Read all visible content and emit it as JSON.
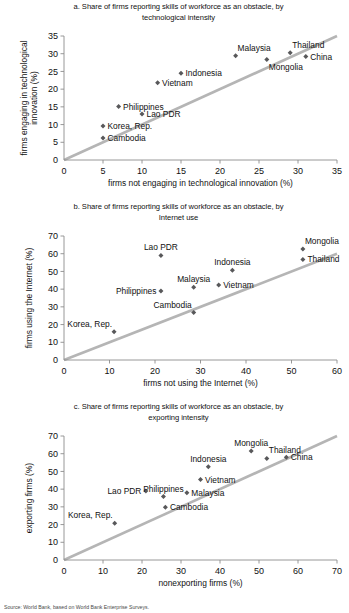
{
  "figure": {
    "source_note": "Source: World Bank, based on World Bank Enterprise Surveys.",
    "marker_color": "#58585a",
    "line_color": "#b5b5b5",
    "axis_color": "#8c8c8c",
    "text_color": "#111111"
  },
  "chart_data": [
    {
      "id": "a",
      "type": "scatter",
      "title": "a. Share of firms reporting skills of workforce as an obstacle, by technological intensity",
      "title_line1": "a. Share of firms reporting skills of workforce as an obstacle, by",
      "title_line2": "technological intensity",
      "xlabel": "firms not engaging in technological innovation (%)",
      "ylabel": "firms engaging in technological innovation (%)",
      "ylabel_line1": "firms engaging in technological",
      "ylabel_line2": "innovation (%)",
      "xlim": [
        0,
        35
      ],
      "ylim": [
        0,
        35
      ],
      "xticks": [
        0,
        5,
        10,
        15,
        20,
        25,
        30,
        35
      ],
      "yticks": [
        0,
        5,
        10,
        15,
        20,
        25,
        30,
        35
      ],
      "grid": false,
      "reference_line": {
        "type": "45-degree",
        "from": [
          0,
          0
        ],
        "to": [
          35,
          35
        ]
      },
      "points": [
        {
          "label": "Cambodia",
          "x": 5.0,
          "y": 6.2,
          "label_pos": "right"
        },
        {
          "label": "Korea, Rep.",
          "x": 5.0,
          "y": 9.6,
          "label_pos": "right"
        },
        {
          "label": "Philippines",
          "x": 7.0,
          "y": 15.1,
          "label_pos": "right"
        },
        {
          "label": "Lao PDR",
          "x": 10.0,
          "y": 13.0,
          "label_pos": "right"
        },
        {
          "label": "Vietnam",
          "x": 12.0,
          "y": 21.8,
          "label_pos": "right"
        },
        {
          "label": "Indonesia",
          "x": 15.0,
          "y": 24.5,
          "label_pos": "right"
        },
        {
          "label": "Malaysia",
          "x": 22.0,
          "y": 29.4,
          "label_pos": "above-right"
        },
        {
          "label": "Mongolia",
          "x": 26.0,
          "y": 28.4,
          "label_pos": "below-right"
        },
        {
          "label": "Thailand",
          "x": 29.0,
          "y": 30.3,
          "label_pos": "above-right"
        },
        {
          "label": "China",
          "x": 31.0,
          "y": 29.2,
          "label_pos": "right"
        }
      ]
    },
    {
      "id": "b",
      "type": "scatter",
      "title": "b. Share of firms reporting skills of workforce as an obstacle, by Internet use",
      "title_line1": "b. Share of firms reporting skills of workforce as an obstacle, by",
      "title_line2": "Internet use",
      "xlabel": "firms not using the Internet (%)",
      "ylabel": "firms using the Internet (%)",
      "xlim": [
        0,
        60
      ],
      "ylim": [
        0,
        70
      ],
      "xticks": [
        0,
        10,
        20,
        30,
        40,
        50,
        60
      ],
      "yticks": [
        0,
        10,
        20,
        30,
        40,
        50,
        60,
        70
      ],
      "grid": false,
      "reference_line": {
        "type": "45-degree",
        "from": [
          0,
          0
        ],
        "to": [
          60,
          60
        ]
      },
      "points": [
        {
          "label": "Korea, Rep.",
          "x": 11.0,
          "y": 16.0,
          "label_pos": "above-left"
        },
        {
          "label": "Lao PDR",
          "x": 21.3,
          "y": 59.0,
          "label_pos": "above"
        },
        {
          "label": "Philippines",
          "x": 21.3,
          "y": 39.0,
          "label_pos": "left"
        },
        {
          "label": "Cambodia",
          "x": 28.5,
          "y": 26.8,
          "label_pos": "above-left"
        },
        {
          "label": "Malaysia",
          "x": 28.5,
          "y": 41.0,
          "label_pos": "above"
        },
        {
          "label": "Vietnam",
          "x": 34.0,
          "y": 42.4,
          "label_pos": "right"
        },
        {
          "label": "Indonesia",
          "x": 37.0,
          "y": 50.7,
          "label_pos": "above"
        },
        {
          "label": "Mongolia",
          "x": 52.5,
          "y": 62.6,
          "label_pos": "above-right"
        },
        {
          "label": "Thailand",
          "x": 52.5,
          "y": 56.8,
          "label_pos": "right"
        }
      ]
    },
    {
      "id": "c",
      "type": "scatter",
      "title": "c. Share of firms reporting skills of workforce as an obstacle, by exporting intensity",
      "title_line1": "c. Share of firms reporting skills of workforce as an obstacle, by",
      "title_line2": "exporting intensity",
      "xlabel": "nonexporting firms (%)",
      "ylabel": "exporting firms (%)",
      "xlim": [
        0,
        70
      ],
      "ylim": [
        0,
        70
      ],
      "xticks": [
        0,
        10,
        20,
        30,
        40,
        50,
        60,
        70
      ],
      "yticks": [
        0,
        10,
        20,
        30,
        40,
        50,
        60,
        70
      ],
      "grid": false,
      "reference_line": {
        "type": "45-degree",
        "from": [
          0,
          0
        ],
        "to": [
          70,
          70
        ]
      },
      "points": [
        {
          "label": "Korea, Rep.",
          "x": 13.0,
          "y": 20.8,
          "label_pos": "above-left"
        },
        {
          "label": "Lao PDR",
          "x": 21.0,
          "y": 39.0,
          "label_pos": "left"
        },
        {
          "label": "Cambodia",
          "x": 26.0,
          "y": 29.8,
          "label_pos": "right"
        },
        {
          "label": "Philippines",
          "x": 25.5,
          "y": 35.8,
          "label_pos": "above"
        },
        {
          "label": "Malaysia",
          "x": 31.5,
          "y": 38.0,
          "label_pos": "right"
        },
        {
          "label": "Vietnam",
          "x": 35.0,
          "y": 45.5,
          "label_pos": "right"
        },
        {
          "label": "Indonesia",
          "x": 37.0,
          "y": 52.6,
          "label_pos": "above"
        },
        {
          "label": "Mongolia",
          "x": 48.0,
          "y": 61.5,
          "label_pos": "above"
        },
        {
          "label": "Thailand",
          "x": 52.0,
          "y": 57.3,
          "label_pos": "above-right"
        },
        {
          "label": "China",
          "x": 57.0,
          "y": 58.0,
          "label_pos": "right"
        }
      ]
    }
  ]
}
